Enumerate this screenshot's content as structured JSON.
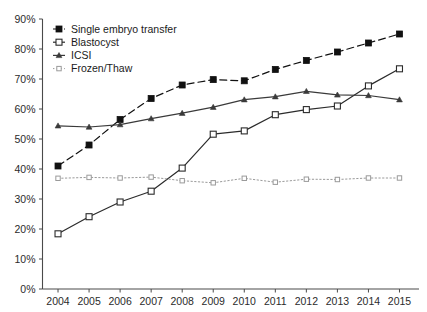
{
  "chart_data": {
    "type": "line",
    "title": "",
    "subtitle": "",
    "xlabel": "",
    "ylabel": "",
    "x": [
      2004,
      2005,
      2006,
      2007,
      2008,
      2009,
      2010,
      2011,
      2012,
      2013,
      2014,
      2015
    ],
    "categories": [
      "2004",
      "2005",
      "2006",
      "2007",
      "2008",
      "2009",
      "2010",
      "2011",
      "2012",
      "2013",
      "2014",
      "2015"
    ],
    "xlim": [
      2004,
      2015
    ],
    "ylim": [
      0,
      90
    ],
    "y_tick_labels": [
      "0%",
      "10%",
      "20%",
      "30%",
      "40%",
      "50%",
      "60%",
      "70%",
      "80%",
      "90%"
    ],
    "y_tick_values": [
      0,
      10,
      20,
      30,
      40,
      50,
      60,
      70,
      80,
      90
    ],
    "grid": false,
    "legend_position": "top-left",
    "series": [
      {
        "name": "Single embryo transfer",
        "values": [
          41.0,
          48.0,
          56.5,
          63.5,
          68.0,
          69.8,
          69.4,
          73.2,
          76.2,
          79.0,
          82.0,
          85.0
        ],
        "line_style": "dashed",
        "marker": "filled-square",
        "color": "#111111"
      },
      {
        "name": "Blastocyst",
        "values": [
          18.4,
          24.1,
          29.0,
          32.6,
          40.3,
          51.6,
          52.7,
          58.1,
          59.8,
          61.0,
          67.7,
          73.4
        ],
        "line_style": "solid",
        "marker": "open-square",
        "color": "#2b2b2b"
      },
      {
        "name": "ICSI",
        "values": [
          54.4,
          54.0,
          54.8,
          56.8,
          58.6,
          60.6,
          63.1,
          64.1,
          65.9,
          64.7,
          64.5,
          63.1
        ],
        "line_style": "solid",
        "marker": "filled-triangle",
        "color": "#3a3a3a"
      },
      {
        "name": "Frozen/Thaw",
        "values": [
          36.9,
          37.2,
          37.0,
          37.3,
          36.1,
          35.4,
          36.9,
          35.6,
          36.6,
          36.5,
          37.0,
          37.0
        ],
        "line_style": "dotted",
        "marker": "small-square",
        "color": "#9a9a9a"
      }
    ]
  },
  "legend": {
    "items": [
      {
        "label": "Single embryo transfer"
      },
      {
        "label": "Blastocyst"
      },
      {
        "label": "ICSI"
      },
      {
        "label": "Frozen/Thaw"
      }
    ]
  }
}
